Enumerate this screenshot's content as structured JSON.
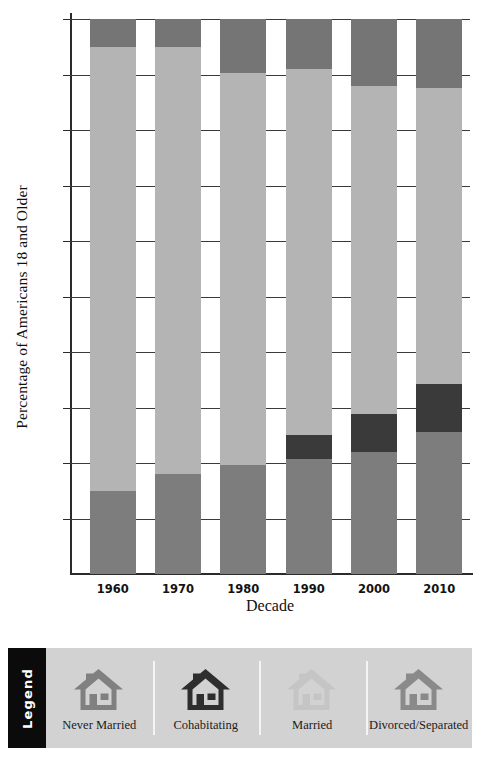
{
  "chart_data": {
    "type": "bar",
    "subtype": "stacked-percentage-column",
    "title": "",
    "xlabel": "Decade",
    "ylabel": "Percentage of Americans 18 and Older",
    "categories": [
      "1960",
      "1970",
      "1980",
      "1990",
      "2000",
      "2010"
    ],
    "ylim": [
      0,
      100
    ],
    "ytick_values": [
      10,
      20,
      30,
      40,
      50,
      60,
      70,
      80,
      90,
      100
    ],
    "ytick_labels": [
      "10%",
      "20%",
      "30%",
      "40%",
      "50%",
      "60%",
      "70%",
      "80%",
      "90%",
      "100%"
    ],
    "grid": true,
    "grid_axis": "y",
    "legend_position": "bottom",
    "stack_order_bottom_to_top": [
      "Never Married",
      "Cohabitating",
      "Married",
      "Divorced/Separated"
    ],
    "series": [
      {
        "name": "Never Married",
        "color": "#7d7d7d",
        "values": [
          15.0,
          18.0,
          19.7,
          20.7,
          22.0,
          25.6
        ]
      },
      {
        "name": "Cohabitating",
        "color": "#3a3a3a",
        "values": [
          0.0,
          0.0,
          0.0,
          4.4,
          6.9,
          8.6
        ]
      },
      {
        "name": "Married",
        "color": "#b4b4b4",
        "values": [
          80.0,
          77.0,
          70.5,
          65.9,
          59.1,
          53.3
        ]
      },
      {
        "name": "Divorced/Separated",
        "color": "#757575",
        "values": [
          5.0,
          5.0,
          9.8,
          9.0,
          12.0,
          12.5
        ]
      }
    ]
  },
  "legend": {
    "title": "Legend",
    "items": [
      {
        "label": "Never Married",
        "icon": "house-icon",
        "color": "#808080"
      },
      {
        "label": "Cohabitating",
        "icon": "house-icon",
        "color": "#2e2e2e"
      },
      {
        "label": "Married",
        "icon": "house-icon",
        "color": "#c5c5c5"
      },
      {
        "label": "Divorced/Separated",
        "icon": "house-icon",
        "color": "#8a8a8a"
      }
    ]
  },
  "colors": {
    "background": "#ffffff",
    "legend_panel": "#d2d2d2",
    "legend_title_bar": "#0b0b0b",
    "axis": "#2b2b2b",
    "gridline": "#3a3a3a"
  }
}
